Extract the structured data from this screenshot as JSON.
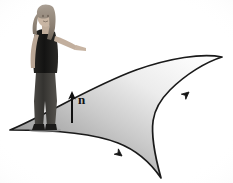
{
  "figure": {
    "kind": "oriented-surface-diagram",
    "background_color": "#ffffff",
    "canvas": {
      "width": 233,
      "height": 183
    }
  },
  "labels": {
    "normal_vector": "n"
  },
  "surface": {
    "name": "curved-surface",
    "outline_color": "#1a1a1a",
    "outline_width": 1.6,
    "gradient": {
      "start_color": "#8d8d8d",
      "mid_color": "#c9c9c9",
      "end_color": "#fbfbfb"
    },
    "vertices": {
      "left_tip": [
        10,
        130
      ],
      "right_cusp": [
        222,
        57
      ],
      "bottom_tip": [
        161,
        178
      ]
    }
  },
  "normal_arrow": {
    "name": "normal-vector-arrow",
    "color": "#111111",
    "tail": [
      72,
      122
    ],
    "head": [
      72,
      93
    ]
  },
  "boundary_arrows": [
    {
      "name": "upper-boundary-arrow",
      "position": [
        188,
        93
      ],
      "angle_deg": -41
    },
    {
      "name": "lower-boundary-arrow",
      "position": [
        121,
        155
      ],
      "angle_deg": 38
    }
  ],
  "person": {
    "name": "standing-person",
    "description": "woman standing on the surface pointing to the right",
    "hair_color": "#9b9086",
    "top_color": "#1c1b1a",
    "jeans_color": "#3b3a38",
    "skin_color": "#c9b5a4",
    "stands_at": [
      46,
      130
    ]
  }
}
